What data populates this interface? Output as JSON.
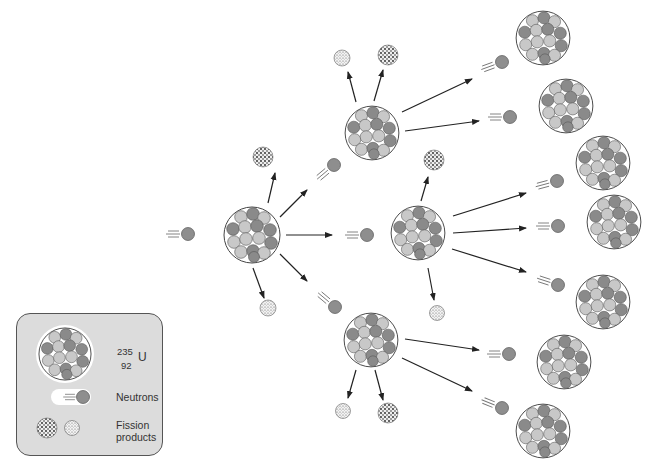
{
  "diagram": {
    "colors": {
      "nucleus_outline": "#444444",
      "nucleon_dark": "#8a8a8a",
      "nucleon_light": "#c8c8c8",
      "neutron": "#8e8e8e",
      "arrow": "#222222",
      "legend_bg": "#dcdcdc"
    }
  },
  "legend": {
    "isotope": {
      "mass_number": "235",
      "atomic_number": "92",
      "symbol": "U"
    },
    "neutrons_label": "Neutrons",
    "fission_label_line1": "Fission",
    "fission_label_line2": "products"
  }
}
